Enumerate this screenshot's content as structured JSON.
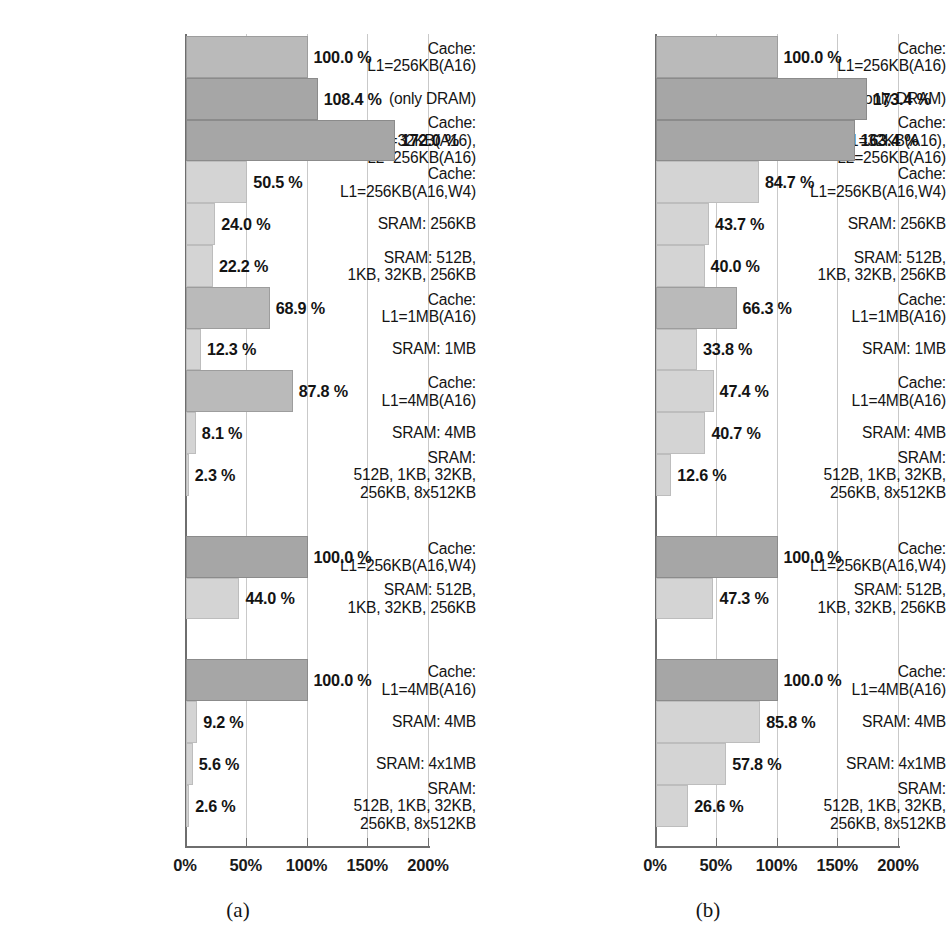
{
  "figure": {
    "width": 952,
    "height": 949,
    "background": "#ffffff",
    "bar_colors": {
      "light": "#d4d4d4",
      "medium": "#bababa",
      "dark": "#a6a6a6"
    },
    "gridline_color": "#c9c9c9",
    "axis_color": "#6e6e6e"
  },
  "chart_data": [
    {
      "type": "bar",
      "orientation": "horizontal",
      "panel_id": "a",
      "caption": "(a)",
      "title": "",
      "xlabel": "",
      "ylabel": "",
      "xlim": [
        0,
        200
      ],
      "xticks": [
        0,
        50,
        100,
        150,
        200
      ],
      "xticklabels": [
        "0%",
        "50%",
        "100%",
        "150%",
        "200%"
      ],
      "grid": true,
      "legend": "none",
      "groups": [
        {
          "group_index": 0,
          "categories": [
            "Cache:\nL1=256KB(A16)",
            "(only DRAM)",
            "Cache:\nL1=32KB(A16),\nL2=256KB(A16)",
            "Cache:\nL1=256KB(A16,W4)",
            "SRAM: 256KB",
            "SRAM: 512B,\n1KB, 32KB, 256KB",
            "Cache:\nL1=1MB(A16)",
            "SRAM: 1MB",
            "Cache:\nL1=4MB(A16)",
            "SRAM: 4MB",
            "SRAM:\n512B, 1KB, 32KB,\n256KB, 8x512KB"
          ],
          "values": [
            100.0,
            108.4,
            172.0,
            50.5,
            24.0,
            22.2,
            68.9,
            12.3,
            87.8,
            8.1,
            2.3
          ],
          "value_labels": [
            "100.0 %",
            "108.4 %",
            "172.0 %",
            "50.5 %",
            "24.0 %",
            "22.2 %",
            "68.9 %",
            "12.3 %",
            "87.8 %",
            "8.1 %",
            "2.3 %"
          ],
          "shades": [
            "medium",
            "dark",
            "dark",
            "light",
            "light",
            "light",
            "medium",
            "light",
            "medium",
            "light",
            "light"
          ]
        },
        {
          "group_index": 1,
          "categories": [
            "Cache:\nL1=256KB(A16,W4)",
            "SRAM: 512B,\n1KB, 32KB, 256KB"
          ],
          "values": [
            100.0,
            44.0
          ],
          "value_labels": [
            "100.0 %",
            "44.0 %"
          ],
          "shades": [
            "dark",
            "light"
          ]
        },
        {
          "group_index": 2,
          "categories": [
            "Cache:\nL1=4MB(A16)",
            "SRAM: 4MB",
            "SRAM: 4x1MB",
            "SRAM:\n512B, 1KB, 32KB,\n256KB, 8x512KB"
          ],
          "values": [
            100.0,
            9.2,
            5.6,
            2.6
          ],
          "value_labels": [
            "100.0 %",
            "9.2 %",
            "5.6 %",
            "2.6 %"
          ],
          "shades": [
            "dark",
            "light",
            "light",
            "light"
          ]
        }
      ]
    },
    {
      "type": "bar",
      "orientation": "horizontal",
      "panel_id": "b",
      "caption": "(b)",
      "title": "",
      "xlabel": "",
      "ylabel": "",
      "xlim": [
        0,
        200
      ],
      "xticks": [
        0,
        50,
        100,
        150,
        200
      ],
      "xticklabels": [
        "0%",
        "50%",
        "100%",
        "150%",
        "200%"
      ],
      "grid": true,
      "legend": "none",
      "groups": [
        {
          "group_index": 0,
          "categories": [
            "Cache:\nL1=256KB(A16)",
            "(only DRAM)",
            "Cache:\nL1=32KB(A16),\nL2=256KB(A16)",
            "Cache:\nL1=256KB(A16,W4)",
            "SRAM: 256KB",
            "SRAM: 512B,\n1KB, 32KB, 256KB",
            "Cache:\nL1=1MB(A16)",
            "SRAM: 1MB",
            "Cache:\nL1=4MB(A16)",
            "SRAM: 4MB",
            "SRAM:\n512B, 1KB, 32KB,\n256KB, 8x512KB"
          ],
          "values": [
            100.0,
            173.4,
            163.4,
            84.7,
            43.7,
            40.0,
            66.3,
            33.8,
            47.4,
            40.7,
            12.6
          ],
          "value_labels": [
            "100.0 %",
            "173.4 %",
            "163.4 %",
            "84.7 %",
            "43.7 %",
            "40.0 %",
            "66.3 %",
            "33.8 %",
            "47.4 %",
            "40.7 %",
            "12.6 %"
          ],
          "shades": [
            "medium",
            "dark",
            "dark",
            "light",
            "light",
            "light",
            "medium",
            "light",
            "light",
            "light",
            "light"
          ]
        },
        {
          "group_index": 1,
          "categories": [
            "Cache:\nL1=256KB(A16,W4)",
            "SRAM: 512B,\n1KB, 32KB, 256KB"
          ],
          "values": [
            100.0,
            47.3
          ],
          "value_labels": [
            "100.0 %",
            "47.3 %"
          ],
          "shades": [
            "dark",
            "light"
          ]
        },
        {
          "group_index": 2,
          "categories": [
            "Cache:\nL1=4MB(A16)",
            "SRAM: 4MB",
            "SRAM: 4x1MB",
            "SRAM:\n512B, 1KB, 32KB,\n256KB, 8x512KB"
          ],
          "values": [
            100.0,
            85.8,
            57.8,
            26.6
          ],
          "value_labels": [
            "100.0 %",
            "85.8 %",
            "57.8 %",
            "26.6 %"
          ],
          "shades": [
            "dark",
            "light",
            "light",
            "light"
          ]
        }
      ]
    }
  ]
}
